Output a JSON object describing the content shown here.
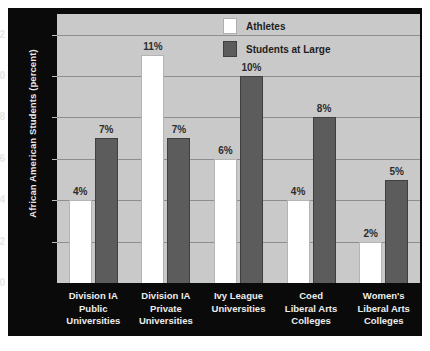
{
  "chart_data": {
    "type": "bar",
    "title": "",
    "xlabel": "",
    "ylabel": "African American Students (percent)",
    "ylim": [
      0,
      13
    ],
    "yticks": [
      0,
      2,
      4,
      6,
      8,
      10,
      12
    ],
    "ytick_labels": [
      "0",
      "2",
      "4",
      "6",
      "8",
      "10",
      "12"
    ],
    "grid": true,
    "legend_position": "top-right",
    "categories": [
      "Division IA Public Universities",
      "Division IA Private Universities",
      "Ivy League Universities",
      "Coed Liberal Arts Colleges",
      "Women's Liberal Arts Colleges"
    ],
    "category_lines": [
      [
        "Division IA",
        "Public",
        "Universities"
      ],
      [
        "Division IA",
        "Private",
        "Universities"
      ],
      [
        "Ivy League",
        "Universities"
      ],
      [
        "Coed",
        "Liberal Arts",
        "Colleges"
      ],
      [
        "Women's",
        "Liberal Arts",
        "Colleges"
      ]
    ],
    "series": [
      {
        "name": "Athletes",
        "color": "#ffffff",
        "values": [
          4,
          11,
          6,
          4,
          2
        ],
        "data_labels": [
          "4%",
          "11%",
          "6%",
          "4%",
          "2%"
        ]
      },
      {
        "name": "Students at Large",
        "color": "#5c5c5c",
        "values": [
          7,
          7,
          10,
          8,
          5
        ],
        "data_labels": [
          "7%",
          "7%",
          "10%",
          "8%",
          "5%"
        ]
      }
    ]
  },
  "legend": {
    "items": [
      {
        "label": "Athletes",
        "swatch": "white-swatch-icon"
      },
      {
        "label": "Students at Large",
        "swatch": "gray-swatch-icon"
      }
    ]
  },
  "colors": {
    "figure_background": "#0a0a0a",
    "plot_background": "#c9c9c9",
    "gridline": "#8e8e8e",
    "athletes_bar": "#ffffff",
    "students_bar": "#5c5c5c",
    "axis_text": "#e8e8e8",
    "label_text": "#2c2c2c"
  }
}
